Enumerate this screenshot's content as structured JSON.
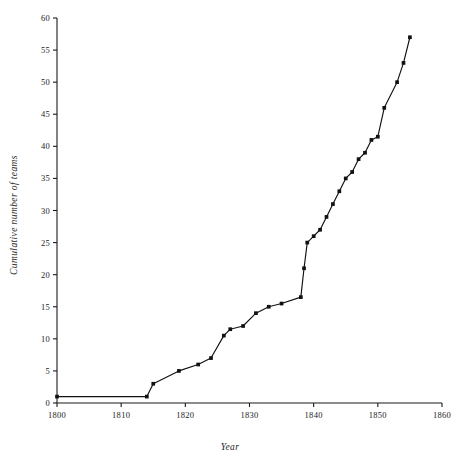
{
  "chart_data": {
    "type": "line",
    "title": "",
    "subtitle": "",
    "xlabel": "Year",
    "ylabel": "Cumulative number of teams",
    "xlim": [
      1800,
      1860
    ],
    "ylim": [
      0,
      60
    ],
    "xticks": [
      1800,
      1810,
      1820,
      1830,
      1840,
      1850,
      1860
    ],
    "xtick_labels": [
      "1800",
      "1810",
      "1820",
      "1830",
      "1840",
      "1850",
      "1860"
    ],
    "yticks": [
      0,
      5,
      10,
      15,
      20,
      25,
      30,
      35,
      40,
      45,
      50,
      55,
      60
    ],
    "ytick_labels": [
      "0",
      "5",
      "10",
      "15",
      "20",
      "25",
      "30",
      "35",
      "40",
      "45",
      "50",
      "55",
      "60"
    ],
    "grid": false,
    "legend": false,
    "legend_position": "none",
    "line_color": "#111111",
    "marker": "square",
    "series": [
      {
        "name": "Cumulative number of teams",
        "x": [
          1800,
          1814,
          1815,
          1819,
          1822,
          1824,
          1826,
          1827,
          1829,
          1831,
          1833,
          1835,
          1838,
          1838.5,
          1839,
          1840,
          1841,
          1842,
          1843,
          1844,
          1845,
          1846,
          1847,
          1848,
          1849,
          1850,
          1851,
          1853,
          1854,
          1855
        ],
        "y": [
          1,
          1,
          3,
          5,
          6,
          7,
          10.5,
          11.5,
          12,
          14,
          15,
          15.5,
          16.5,
          21,
          25,
          26,
          27,
          29,
          31,
          33,
          35,
          36,
          38,
          39,
          41,
          41.5,
          46,
          50,
          53,
          57
        ],
        "values": [
          1,
          1,
          3,
          5,
          6,
          7,
          10.5,
          11.5,
          12,
          14,
          15,
          15.5,
          16.5,
          21,
          25,
          26,
          27,
          29,
          31,
          33,
          35,
          36,
          38,
          39,
          41,
          41.5,
          46,
          50,
          53,
          57
        ]
      }
    ],
    "annotations": []
  },
  "axes": {
    "x_title": "Year",
    "y_title": "Cumulative number of teams"
  }
}
